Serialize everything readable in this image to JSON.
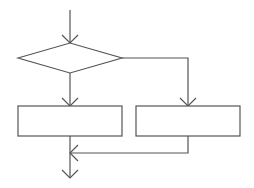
{
  "diagram": {
    "type": "flowchart",
    "structure": "if-else (selection) control flow",
    "line_color": "#555555",
    "background": "#ffffff",
    "nodes": [
      {
        "id": "decision",
        "shape": "diamond",
        "label": ""
      },
      {
        "id": "process-left",
        "shape": "rectangle",
        "label": ""
      },
      {
        "id": "process-right",
        "shape": "rectangle",
        "label": ""
      }
    ],
    "edges": [
      {
        "from": "entry",
        "to": "decision",
        "arrow": "down"
      },
      {
        "from": "decision",
        "to": "process-left",
        "arrow": "down",
        "label": ""
      },
      {
        "from": "decision",
        "to": "process-right",
        "arrow": "down",
        "label": ""
      },
      {
        "from": "process-right",
        "to": "merge",
        "arrow": "left"
      },
      {
        "from": "process-left",
        "to": "exit",
        "arrow": "down"
      }
    ]
  }
}
